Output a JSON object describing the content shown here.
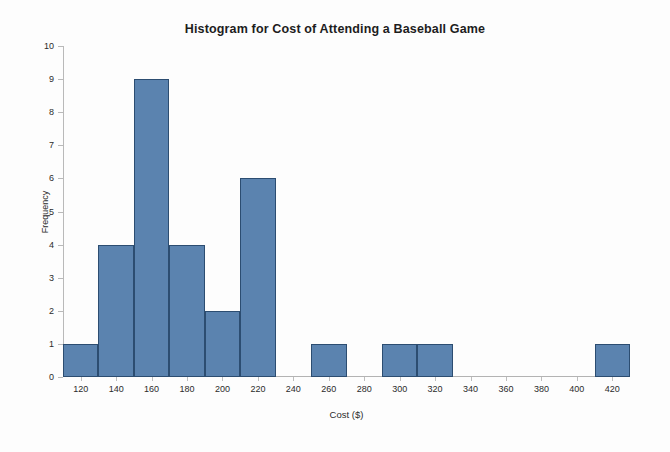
{
  "chart_data": {
    "type": "bar",
    "title": "Histogram for Cost of Attending a Baseball Game",
    "xlabel": "Cost ($)",
    "ylabel": "Frequency",
    "grid": false,
    "legend": null,
    "xlim": [
      110,
      430
    ],
    "ylim": [
      0,
      10
    ],
    "bin_width": 20,
    "xticks": [
      120,
      140,
      160,
      180,
      200,
      220,
      240,
      260,
      280,
      300,
      320,
      340,
      360,
      380,
      400,
      420
    ],
    "xtick_labels": [
      "120",
      "140",
      "160",
      "180",
      "200",
      "220",
      "240",
      "260",
      "280",
      "300",
      "320",
      "340",
      "360",
      "380",
      "400",
      "420"
    ],
    "yticks": [
      0,
      1,
      2,
      3,
      4,
      5,
      6,
      7,
      8,
      9,
      10
    ],
    "ytick_labels": [
      "0",
      "1",
      "2",
      "3",
      "4",
      "5",
      "6",
      "7",
      "8",
      "9",
      "10"
    ],
    "categories": [
      "120",
      "140",
      "160",
      "180",
      "200",
      "220",
      "240",
      "260",
      "280",
      "300",
      "320",
      "340",
      "360",
      "380",
      "400",
      "420"
    ],
    "values": [
      1,
      4,
      9,
      4,
      2,
      6,
      0,
      1,
      0,
      1,
      1,
      0,
      0,
      0,
      0,
      1
    ],
    "bins": [
      {
        "center": 120,
        "start": 110,
        "end": 130,
        "frequency": 1
      },
      {
        "center": 140,
        "start": 130,
        "end": 150,
        "frequency": 4
      },
      {
        "center": 160,
        "start": 150,
        "end": 170,
        "frequency": 9
      },
      {
        "center": 180,
        "start": 170,
        "end": 190,
        "frequency": 4
      },
      {
        "center": 200,
        "start": 190,
        "end": 210,
        "frequency": 2
      },
      {
        "center": 220,
        "start": 210,
        "end": 230,
        "frequency": 6
      },
      {
        "center": 240,
        "start": 230,
        "end": 250,
        "frequency": 0
      },
      {
        "center": 260,
        "start": 250,
        "end": 270,
        "frequency": 1
      },
      {
        "center": 280,
        "start": 270,
        "end": 290,
        "frequency": 0
      },
      {
        "center": 300,
        "start": 290,
        "end": 310,
        "frequency": 1
      },
      {
        "center": 320,
        "start": 310,
        "end": 330,
        "frequency": 1
      },
      {
        "center": 340,
        "start": 330,
        "end": 350,
        "frequency": 0
      },
      {
        "center": 360,
        "start": 350,
        "end": 370,
        "frequency": 0
      },
      {
        "center": 380,
        "start": 370,
        "end": 390,
        "frequency": 0
      },
      {
        "center": 400,
        "start": 390,
        "end": 410,
        "frequency": 0
      },
      {
        "center": 420,
        "start": 410,
        "end": 430,
        "frequency": 1
      }
    ],
    "colors": {
      "bar_fill": "#5b83af",
      "bar_border": "#2c4d71",
      "axis": "#b9b9b9",
      "text": "#2b2b2b",
      "background": "#fdfdfd"
    }
  }
}
